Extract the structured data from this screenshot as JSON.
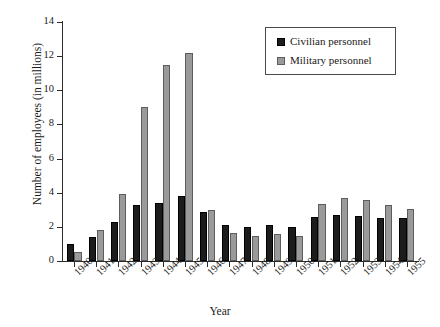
{
  "chart_data": {
    "type": "bar",
    "title": "",
    "xlabel": "Year",
    "ylabel": "Number of employees (in millions)",
    "ylim": [
      0,
      14
    ],
    "ytick_step": 2,
    "yticks": [
      0,
      2,
      4,
      6,
      8,
      10,
      12,
      14
    ],
    "grid": false,
    "legend_position": "top-right",
    "categories": [
      "1940",
      "1941",
      "1942",
      "1943",
      "1944",
      "1945",
      "1946",
      "1947",
      "1948",
      "1949",
      "1950",
      "1951",
      "1952",
      "1953",
      "1954",
      "1955"
    ],
    "series": [
      {
        "name": "Civilian personnel",
        "color": "#1c1c1c",
        "values": [
          1.0,
          1.4,
          2.3,
          3.3,
          3.4,
          3.8,
          2.9,
          2.1,
          2.0,
          2.1,
          2.0,
          2.6,
          2.7,
          2.65,
          2.5,
          2.5
        ]
      },
      {
        "name": "Military personnel",
        "color": "#9a9a9a",
        "values": [
          0.5,
          1.8,
          3.9,
          9.0,
          11.5,
          12.2,
          3.0,
          1.65,
          1.45,
          1.6,
          1.45,
          3.35,
          3.7,
          3.6,
          3.3,
          3.05
        ]
      }
    ]
  },
  "legend": {
    "entries": [
      {
        "label": "Civilian personnel",
        "swatch": "civilian-swatch"
      },
      {
        "label": "Military personnel",
        "swatch": "military-swatch"
      }
    ]
  }
}
